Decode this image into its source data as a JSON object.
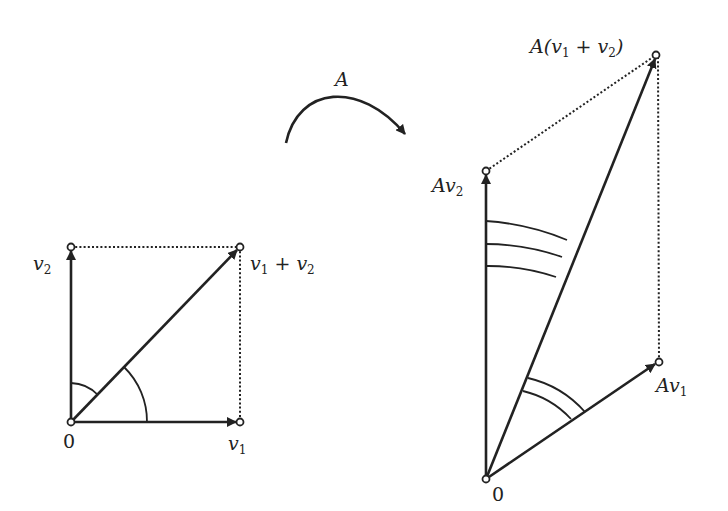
{
  "diagram": {
    "left": {
      "origin_label": "0",
      "v1_label": "v",
      "v1_sub": "1",
      "v2_label": "v",
      "v2_sub": "2",
      "sum_label_a": "v",
      "sum_sub_a": "1",
      "sum_plus": " + ",
      "sum_label_b": "v",
      "sum_sub_b": "2"
    },
    "map": {
      "label": "A"
    },
    "right": {
      "origin_label": "0",
      "av1_label": "Av",
      "av1_sub": "1",
      "av2_label": "Av",
      "av2_sub": "2",
      "asum_prefix": "A(v",
      "asum_sub_a": "1",
      "asum_plus": " + v",
      "asum_sub_b": "2",
      "asum_suffix": ")"
    },
    "colors": {
      "stroke": "#222222",
      "background": "#ffffff"
    }
  }
}
